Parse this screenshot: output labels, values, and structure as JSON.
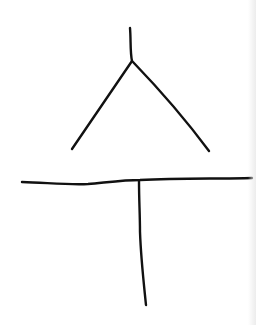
{
  "drawing": {
    "stroke_color": "#111111",
    "stroke_width": 2.4,
    "background": "#ffffff",
    "strokes": [
      {
        "name": "top-stem",
        "d": "M130,28 C131,40 130,52 132,61"
      },
      {
        "name": "left-leg",
        "d": "M132,61 C112,90 92,120 72,149"
      },
      {
        "name": "right-leg",
        "d": "M133,62 C160,90 186,120 209,151"
      },
      {
        "name": "crossbar",
        "d": "M22,182 C50,183 70,185 88,184 C110,182 125,180 140,180 C180,178 220,179 252,178"
      },
      {
        "name": "vertical-post",
        "d": "M139,181 C139,200 140,215 140,232 C141,260 144,285 146,305"
      }
    ]
  }
}
